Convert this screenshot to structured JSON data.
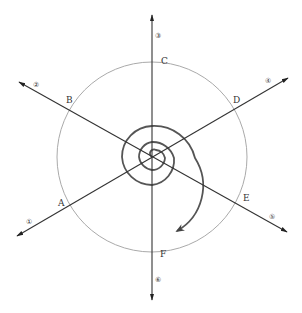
{
  "diagram": {
    "title": "",
    "center": {
      "x": 152,
      "y": 157
    },
    "colors": {
      "axis": "#333333",
      "spiral": "#555555",
      "circle": "#aaaaaa",
      "text": "#333333"
    },
    "outer_circle": {
      "radius": 95
    },
    "axes": [
      {
        "id": "1",
        "symbol": "①",
        "point_label": "A"
      },
      {
        "id": "2",
        "symbol": "②",
        "point_label": "B"
      },
      {
        "id": "3",
        "symbol": "③",
        "point_label": "C"
      },
      {
        "id": "4",
        "symbol": "④",
        "point_label": "D"
      },
      {
        "id": "5",
        "symbol": "⑤",
        "point_label": "E"
      },
      {
        "id": "6",
        "symbol": "⑥",
        "point_label": "F"
      }
    ],
    "labels": {
      "axis_1": "①",
      "axis_2": "②",
      "axis_3": "③",
      "axis_4": "④",
      "axis_5": "⑤",
      "axis_6": "⑥",
      "point_a": "A",
      "point_b": "B",
      "point_c": "C",
      "point_d": "D",
      "point_e": "E",
      "point_f": "F"
    },
    "spiral": {
      "direction": "clockwise",
      "turns": 3
    }
  }
}
